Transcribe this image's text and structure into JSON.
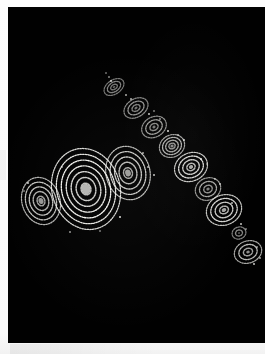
{
  "image": {
    "title": "Speckle spiral interferogram",
    "medium": "photographic print",
    "background_color": "#010101",
    "border_color": "#ffffff",
    "speckle_color": "#f2f2ee",
    "plate": {
      "x": 8,
      "y": 7,
      "width": 257,
      "height": 336
    }
  },
  "chart_data": {
    "type": "scatter",
    "xlabel": "",
    "ylabel": "",
    "xlim": [
      0,
      257
    ],
    "ylim": [
      0,
      336
    ],
    "grid": false,
    "legend": "none",
    "groups": [
      {
        "name": "lower-left-cluster",
        "count": 3,
        "items": [
          {
            "id": "cluster-1",
            "cx": 33,
            "cy": 194,
            "rx": 19,
            "ry": 24,
            "rings": 5,
            "rotation": -18,
            "brightness": 0.82
          },
          {
            "id": "cluster-2",
            "cx": 78,
            "cy": 182,
            "rx": 34,
            "ry": 41,
            "rings": 7,
            "rotation": -16,
            "brightness": 1.0
          },
          {
            "id": "cluster-3",
            "cx": 120,
            "cy": 166,
            "rx": 22,
            "ry": 27,
            "rings": 5,
            "rotation": -14,
            "brightness": 0.86
          }
        ]
      },
      {
        "name": "diagonal-chain",
        "count": 9,
        "items": [
          {
            "id": "chain-1",
            "cx": 106,
            "cy": 80,
            "rx": 11,
            "ry": 7,
            "rings": 3,
            "rotation": -34,
            "brightness": 0.55
          },
          {
            "id": "chain-2",
            "cx": 128,
            "cy": 101,
            "rx": 13,
            "ry": 9,
            "rings": 3,
            "rotation": -32,
            "brightness": 0.62
          },
          {
            "id": "chain-3",
            "cx": 146,
            "cy": 120,
            "rx": 13,
            "ry": 10,
            "rings": 3,
            "rotation": -30,
            "brightness": 0.66
          },
          {
            "id": "chain-4",
            "cx": 164,
            "cy": 139,
            "rx": 13,
            "ry": 11,
            "rings": 4,
            "rotation": -28,
            "brightness": 0.74
          },
          {
            "id": "chain-5",
            "cx": 183,
            "cy": 160,
            "rx": 17,
            "ry": 14,
            "rings": 4,
            "rotation": -26,
            "brightness": 0.92
          },
          {
            "id": "chain-6",
            "cx": 200,
            "cy": 182,
            "rx": 13,
            "ry": 11,
            "rings": 3,
            "rotation": -24,
            "brightness": 0.7
          },
          {
            "id": "chain-7",
            "cx": 216,
            "cy": 203,
            "rx": 18,
            "ry": 15,
            "rings": 4,
            "rotation": -22,
            "brightness": 0.9
          },
          {
            "id": "chain-8",
            "cx": 231,
            "cy": 226,
            "rx": 7,
            "ry": 6,
            "rings": 2,
            "rotation": -20,
            "brightness": 0.6
          },
          {
            "id": "chain-9",
            "cx": 240,
            "cy": 245,
            "rx": 14,
            "ry": 11,
            "rings": 3,
            "rotation": -20,
            "brightness": 0.78
          }
        ]
      }
    ],
    "stray_specks": [
      {
        "x": 98,
        "y": 66,
        "r": 1.2
      },
      {
        "x": 101,
        "y": 70,
        "r": 0.9
      },
      {
        "x": 118,
        "y": 88,
        "r": 0.8
      },
      {
        "x": 123,
        "y": 92,
        "r": 1.0
      },
      {
        "x": 141,
        "y": 107,
        "r": 0.9
      },
      {
        "x": 146,
        "y": 104,
        "r": 0.7
      },
      {
        "x": 152,
        "y": 112,
        "r": 0.8
      },
      {
        "x": 170,
        "y": 128,
        "r": 0.9
      },
      {
        "x": 176,
        "y": 133,
        "r": 0.7
      },
      {
        "x": 193,
        "y": 152,
        "r": 0.8
      },
      {
        "x": 199,
        "y": 157,
        "r": 0.9
      },
      {
        "x": 207,
        "y": 172,
        "r": 0.8
      },
      {
        "x": 212,
        "y": 177,
        "r": 0.7
      },
      {
        "x": 224,
        "y": 196,
        "r": 0.9
      },
      {
        "x": 233,
        "y": 217,
        "r": 1.0
      },
      {
        "x": 238,
        "y": 222,
        "r": 0.8
      },
      {
        "x": 249,
        "y": 240,
        "r": 0.8
      },
      {
        "x": 252,
        "y": 251,
        "r": 0.9
      },
      {
        "x": 246,
        "y": 257,
        "r": 0.7
      },
      {
        "x": 20,
        "y": 176,
        "r": 0.9
      },
      {
        "x": 16,
        "y": 184,
        "r": 0.7
      },
      {
        "x": 54,
        "y": 160,
        "r": 0.8
      },
      {
        "x": 140,
        "y": 160,
        "r": 0.7
      },
      {
        "x": 146,
        "y": 168,
        "r": 0.8
      },
      {
        "x": 112,
        "y": 210,
        "r": 0.7
      },
      {
        "x": 92,
        "y": 224,
        "r": 0.8
      },
      {
        "x": 62,
        "y": 225,
        "r": 0.7
      },
      {
        "x": 135,
        "y": 146,
        "r": 0.8
      },
      {
        "x": 103,
        "y": 74,
        "r": 0.7
      },
      {
        "x": 160,
        "y": 124,
        "r": 0.7
      }
    ]
  }
}
